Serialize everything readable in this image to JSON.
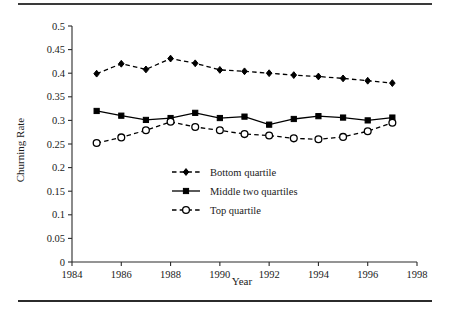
{
  "figure": {
    "has_top_rule": true,
    "has_bottom_rule": true,
    "background_color": "#ffffff",
    "ink_color": "#000000"
  },
  "chart_data": {
    "type": "line",
    "title": "",
    "subtitle": "",
    "xlabel": "Year",
    "ylabel": "Churning Rate",
    "xlim": [
      1984,
      1998
    ],
    "ylim": [
      0,
      0.5
    ],
    "grid": false,
    "legend_position": "inside-center",
    "xticks": [
      1984,
      1986,
      1988,
      1990,
      1992,
      1994,
      1996,
      1998
    ],
    "xtick_labels": [
      "1984",
      "1986",
      "1988",
      "1990",
      "1992",
      "1994",
      "1996",
      "1998"
    ],
    "yticks": [
      0,
      0.05,
      0.1,
      0.15,
      0.2,
      0.25,
      0.3,
      0.35,
      0.4,
      0.45,
      0.5
    ],
    "ytick_labels": [
      "0",
      "0.05",
      "0.1",
      "0.15",
      "0.2",
      "0.25",
      "0.3",
      "0.35",
      "0.4",
      "0.45",
      "0.5"
    ],
    "x": [
      1985,
      1986,
      1987,
      1988,
      1989,
      1990,
      1991,
      1992,
      1993,
      1994,
      1995,
      1996,
      1997
    ],
    "series": [
      {
        "name": "Bottom quartile",
        "marker": "diamond",
        "line_style": "dashed",
        "values": [
          0.399,
          0.42,
          0.408,
          0.431,
          0.421,
          0.407,
          0.404,
          0.4,
          0.396,
          0.393,
          0.389,
          0.384,
          0.379
        ]
      },
      {
        "name": "Middle two quartiles",
        "marker": "square",
        "line_style": "solid",
        "values": [
          0.32,
          0.31,
          0.301,
          0.305,
          0.316,
          0.305,
          0.308,
          0.291,
          0.303,
          0.309,
          0.306,
          0.3,
          0.306
        ]
      },
      {
        "name": "Top quartile",
        "marker": "circle",
        "line_style": "dashed",
        "values": [
          0.252,
          0.264,
          0.279,
          0.297,
          0.286,
          0.279,
          0.271,
          0.268,
          0.262,
          0.26,
          0.265,
          0.277,
          0.295
        ]
      }
    ],
    "legend": [
      {
        "label": "Bottom quartile",
        "marker": "diamond",
        "line_style": "dashed"
      },
      {
        "label": "Middle two quartiles",
        "marker": "square",
        "line_style": "solid"
      },
      {
        "label": "Top quartile",
        "marker": "circle",
        "line_style": "dashed"
      }
    ]
  }
}
